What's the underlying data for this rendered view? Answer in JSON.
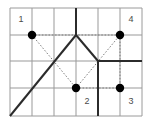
{
  "figure": {
    "background_color": "#ffffff",
    "grid": {
      "columns": 6,
      "rows": 4,
      "x_lines": [
        10,
        32,
        54,
        76,
        98,
        120,
        142
      ],
      "y_lines": [
        8,
        35,
        61,
        88,
        116
      ],
      "line_color": "#999999",
      "line_width": 1,
      "border_color": "#9a9a9a"
    },
    "points": [
      {
        "id": "point-1",
        "label": "1",
        "x": 32,
        "y": 35,
        "radius": 4.2,
        "color": "#000000",
        "label_x": 21,
        "label_y": 20
      },
      {
        "id": "point-2",
        "label": "2",
        "x": 76,
        "y": 88,
        "radius": 4.2,
        "color": "#000000",
        "label_x": 87,
        "label_y": 102
      },
      {
        "id": "point-3",
        "label": "3",
        "x": 120,
        "y": 88,
        "radius": 4.2,
        "color": "#000000",
        "label_x": 131,
        "label_y": 102
      },
      {
        "id": "point-4",
        "label": "4",
        "x": 120,
        "y": 35,
        "radius": 4.2,
        "color": "#000000",
        "label_x": 131,
        "label_y": 20
      }
    ],
    "solid_paths": [
      {
        "id": "path-ascending-diagonal",
        "d": "M 10 116 L 76 35",
        "color": "#2b2b2b",
        "width": 2
      },
      {
        "id": "path-descending-diagonal",
        "d": "M 76 35 L 98 61",
        "color": "#2b2b2b",
        "width": 2
      },
      {
        "id": "path-horizontal-right",
        "d": "M 98 61 L 142 61",
        "color": "#2b2b2b",
        "width": 2
      },
      {
        "id": "path-vertical-top",
        "d": "M 76 8 L 76 35",
        "color": "#2b2b2b",
        "width": 2
      },
      {
        "id": "path-vertical-bottom",
        "d": "M 98 61 L 98 116",
        "color": "#2b2b2b",
        "width": 2
      }
    ],
    "dotted_paths": [
      {
        "id": "dotted-horizontal-top",
        "d": "M 32 35 L 120 35",
        "color": "#7a7a7a",
        "width": 1,
        "dash": "1.5,1.8"
      },
      {
        "id": "dotted-horizontal-bottom",
        "d": "M 76 88 L 120 88",
        "color": "#7a7a7a",
        "width": 1,
        "dash": "1.5,1.8"
      },
      {
        "id": "dotted-vertical-right",
        "d": "M 120 35 L 120 88",
        "color": "#7a7a7a",
        "width": 1,
        "dash": "1.5,1.8"
      },
      {
        "id": "dotted-diagonal-1-to-2",
        "d": "M 32 35 L 76 88",
        "color": "#7a7a7a",
        "width": 1,
        "dash": "1.5,1.8"
      },
      {
        "id": "dotted-diagonal-2-to-4",
        "d": "M 76 88 L 120 35",
        "color": "#7a7a7a",
        "width": 1,
        "dash": "1.5,1.8"
      }
    ]
  },
  "chart_data": {
    "type": "scatter",
    "title": "",
    "xlabel": "",
    "ylabel": "",
    "grid": true,
    "legend": "none",
    "xlim": [
      0,
      6
    ],
    "ylim": [
      0,
      4
    ],
    "categories": [
      "1",
      "2",
      "3",
      "4"
    ],
    "points": [
      {
        "label": "1",
        "x": 1,
        "y": 3
      },
      {
        "label": "2",
        "x": 3,
        "y": 1
      },
      {
        "label": "3",
        "x": 5,
        "y": 1
      },
      {
        "label": "4",
        "x": 5,
        "y": 3
      }
    ],
    "series": [
      {
        "name": "solid-path",
        "style": "solid",
        "vertices": [
          [
            0,
            0
          ],
          [
            3,
            3
          ],
          [
            4,
            2
          ],
          [
            6,
            2
          ]
        ]
      },
      {
        "name": "solid-vertical-top",
        "style": "solid",
        "vertices": [
          [
            3,
            4
          ],
          [
            3,
            3
          ]
        ]
      },
      {
        "name": "solid-vertical-bottom",
        "style": "solid",
        "vertices": [
          [
            4,
            2
          ],
          [
            4,
            0
          ]
        ]
      },
      {
        "name": "dotted-connections",
        "style": "dotted",
        "vertices": [
          [
            1,
            3
          ],
          [
            5,
            3
          ],
          [
            5,
            1
          ],
          [
            3,
            1
          ],
          [
            1,
            3
          ]
        ]
      }
    ]
  }
}
